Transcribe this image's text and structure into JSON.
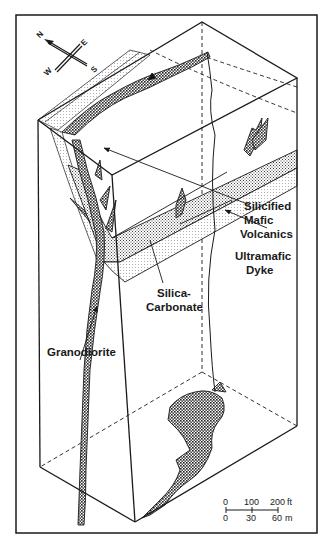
{
  "figure": {
    "type": "isometric block diagram (geological cross-section)",
    "frame_color": "#1a1a1a",
    "background": "#ffffff"
  },
  "compass": {
    "labels": {
      "north": "N",
      "east": "E",
      "south": "S",
      "west": "W"
    }
  },
  "labels": {
    "silicified_mafic_volcanics": [
      "Silicified",
      "Mafic",
      "Volcanics"
    ],
    "ultramafic_dyke": [
      "Ultramafic",
      "Dyke"
    ],
    "silica_carbonate": [
      "Silica-",
      "Carbonate"
    ],
    "granodiorite": "Granodiorite"
  },
  "scale_bar": {
    "feet": {
      "ticks": [
        "0",
        "100",
        "200"
      ],
      "unit": "ft"
    },
    "meters": {
      "ticks": [
        "0",
        "30",
        "60"
      ],
      "unit": "m"
    }
  }
}
